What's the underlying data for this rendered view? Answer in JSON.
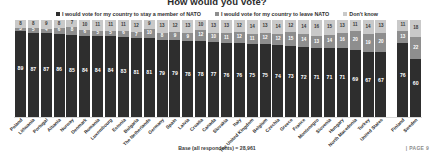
{
  "title": "How would you vote?",
  "legend": {
    "position": "top-center",
    "items": [
      {
        "label": "I would vote for my country to stay a member of NATO",
        "color": "#2e2e2e",
        "key": "stay"
      },
      {
        "label": "I would vote for my country to leave NATO",
        "color": "#8e8e8e",
        "key": "leave"
      },
      {
        "label": "Don't know",
        "color": "#c9c9c9",
        "key": "dont_know"
      }
    ]
  },
  "footer": {
    "base_note": "Base (all respondents) = 28,961",
    "page_note": "| PAGE 9"
  },
  "chart_data": {
    "type": "bar",
    "subtype": "stacked-column-100",
    "title": "How would you vote?",
    "xlabel": "",
    "ylabel": "",
    "ylim": [
      0,
      100
    ],
    "grid": false,
    "legend_position": "top-center",
    "unit": "%",
    "base_note": "Base (all respondents) = 28,961",
    "categories": [
      "Poland",
      "Lithuania",
      "Portugal",
      "Albania",
      "Norway",
      "Denmark",
      "Romania",
      "Luxembourg",
      "Estonia",
      "Bulgaria",
      "The Netherlands",
      "Germany",
      "Spain",
      "Latvia",
      "Croatia",
      "Canada",
      "Slovakia",
      "Italy",
      "The United Kingdom",
      "Belgium",
      "Czechia",
      "Greece",
      "France",
      "Montenegro",
      "Slovenia",
      "Hungary",
      "North Macedonia",
      "Turkey",
      "United States",
      "Finland",
      "Sweden"
    ],
    "series": [
      {
        "name": "I would vote for my country to stay a member of NATO",
        "key": "stay",
        "color": "#2e2e2e",
        "values": [
          89,
          87,
          87,
          86,
          85,
          84,
          84,
          84,
          83,
          81,
          81,
          79,
          79,
          78,
          78,
          77,
          76,
          76,
          75,
          75,
          74,
          73,
          72,
          71,
          71,
          71,
          69,
          67,
          67,
          76,
          60
        ]
      },
      {
        "name": "I would vote for my country to leave NATO",
        "key": "leave",
        "color": "#8e8e8e",
        "values": [
          3,
          5,
          4,
          6,
          8,
          6,
          5,
          5,
          6,
          7,
          10,
          8,
          9,
          9,
          12,
          10,
          11,
          12,
          11,
          12,
          12,
          15,
          14,
          13,
          14,
          16,
          20,
          19,
          20,
          13,
          22
        ]
      },
      {
        "name": "Don't know",
        "key": "dont_know",
        "color": "#c9c9c9",
        "values": [
          8,
          8,
          9,
          8,
          7,
          10,
          11,
          11,
          11,
          12,
          9,
          13,
          12,
          13,
          10,
          13,
          13,
          12,
          14,
          13,
          14,
          12,
          14,
          16,
          15,
          13,
          11,
          14,
          13,
          11,
          18
        ]
      }
    ],
    "separated_group": {
      "after_index": 28,
      "members": [
        "Finland",
        "Sweden"
      ],
      "note": "non-member countries shown separately"
    }
  }
}
